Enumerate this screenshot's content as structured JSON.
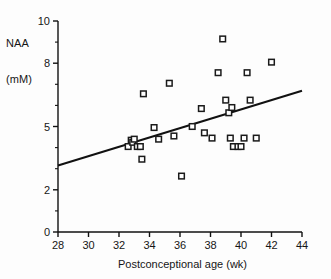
{
  "figure": {
    "background": "#ffffff",
    "ink": "#111111"
  },
  "chart_data": {
    "type": "scatter",
    "title": "",
    "xlabel": "Postconceptional age (wk)",
    "ylabel_line1": "NAA",
    "ylabel_line2": "(mM)",
    "ylabel_full": "NAA (mM)",
    "xlim": [
      28,
      44
    ],
    "ylim": [
      0,
      10
    ],
    "xticks": [
      28,
      30,
      32,
      34,
      36,
      38,
      40,
      42,
      44
    ],
    "xticklabels": [
      "28",
      "30",
      "32",
      "34",
      "36",
      "38",
      "40",
      "42",
      "44"
    ],
    "yticks": [
      0,
      2,
      5,
      8,
      10
    ],
    "yticklabels": [
      "0",
      "2",
      "5",
      "8",
      "10"
    ],
    "yminorticks": [
      1,
      3,
      4,
      6,
      7,
      9
    ],
    "grid": false,
    "legend": null,
    "marker": "open-square",
    "marker_color": "#1a1a1a",
    "marker_fill": "#ffffff",
    "points": [
      {
        "x": 32.6,
        "y": 4.05
      },
      {
        "x": 32.8,
        "y": 4.35
      },
      {
        "x": 32.9,
        "y": 4.25
      },
      {
        "x": 33.0,
        "y": 4.4
      },
      {
        "x": 33.2,
        "y": 4.05
      },
      {
        "x": 33.4,
        "y": 4.05
      },
      {
        "x": 33.5,
        "y": 3.45
      },
      {
        "x": 33.6,
        "y": 6.55
      },
      {
        "x": 34.3,
        "y": 4.95
      },
      {
        "x": 34.6,
        "y": 4.4
      },
      {
        "x": 35.3,
        "y": 7.05
      },
      {
        "x": 35.6,
        "y": 4.55
      },
      {
        "x": 36.1,
        "y": 2.65
      },
      {
        "x": 36.8,
        "y": 5.0
      },
      {
        "x": 37.4,
        "y": 5.85
      },
      {
        "x": 37.6,
        "y": 4.7
      },
      {
        "x": 38.1,
        "y": 4.45
      },
      {
        "x": 38.5,
        "y": 7.55
      },
      {
        "x": 38.8,
        "y": 9.15
      },
      {
        "x": 39.0,
        "y": 6.25
      },
      {
        "x": 39.2,
        "y": 5.65
      },
      {
        "x": 39.3,
        "y": 4.45
      },
      {
        "x": 39.4,
        "y": 5.9
      },
      {
        "x": 39.5,
        "y": 4.05
      },
      {
        "x": 39.8,
        "y": 4.05
      },
      {
        "x": 40.0,
        "y": 4.05
      },
      {
        "x": 40.2,
        "y": 4.45
      },
      {
        "x": 40.4,
        "y": 7.55
      },
      {
        "x": 40.6,
        "y": 6.25
      },
      {
        "x": 41.0,
        "y": 4.45
      },
      {
        "x": 42.0,
        "y": 8.05
      }
    ],
    "regression_line": {
      "x_start": 28,
      "y_start": 3.15,
      "x_end": 44,
      "y_end": 6.7
    }
  }
}
